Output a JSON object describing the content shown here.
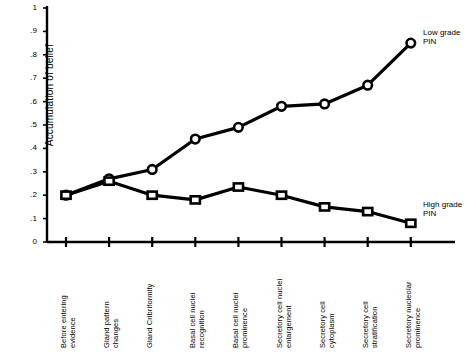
{
  "chart_data": {
    "type": "line",
    "title": "",
    "xlabel": "",
    "ylabel": "Accumulation of belief",
    "ylim": [
      0,
      1
    ],
    "grid": false,
    "legend_position": "inline-right",
    "categories": [
      "Before entering evidence",
      "Gland pattern changes",
      "Gland Cribriformity",
      "Basal cell nuclei recognition",
      "Basal cell nuclei prominence",
      "Secretory cell nuclei enlargement",
      "Secretory cell cytoplasm",
      "Secretory cell stratification",
      "Secretory nucleolar prominence"
    ],
    "ytick_labels": [
      "1",
      ".9",
      ".8",
      ".7",
      ".6",
      ".5",
      ".4",
      ".3",
      ".2",
      ".1",
      "0"
    ],
    "ytick_values": [
      1,
      0.9,
      0.8,
      0.7,
      0.6,
      0.5,
      0.4,
      0.3,
      0.2,
      0.1,
      0
    ],
    "series": [
      {
        "name": "Low grade PIN",
        "marker": "circle",
        "label_text": "Low grade\nPIN",
        "values": [
          0.2,
          0.27,
          0.31,
          0.44,
          0.49,
          0.58,
          0.59,
          0.67,
          0.85
        ]
      },
      {
        "name": "High grade PIN",
        "marker": "square",
        "label_text": "High grade\nPIN",
        "values": [
          0.2,
          0.26,
          0.2,
          0.18,
          0.235,
          0.2,
          0.15,
          0.13,
          0.08
        ]
      }
    ]
  }
}
